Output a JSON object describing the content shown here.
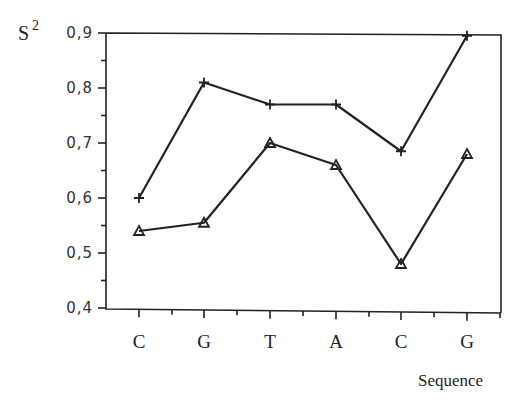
{
  "chart_data": {
    "type": "line",
    "title": "",
    "xlabel": "Sequence",
    "ylabel": "S2",
    "ylabel_display": {
      "base": "S",
      "superscript": "2"
    },
    "categories": [
      "C",
      "G",
      "T",
      "A",
      "C",
      "G"
    ],
    "y_ticks": [
      "0,4",
      "0,5",
      "0,6",
      "0,7",
      "0,8",
      "0,9"
    ],
    "y_tick_values": [
      0.4,
      0.5,
      0.6,
      0.7,
      0.8,
      0.9
    ],
    "ylim": [
      0.4,
      0.9
    ],
    "grid": false,
    "legend": null,
    "series": [
      {
        "name": "plus-marker series",
        "marker": "+",
        "values": [
          0.6,
          0.81,
          0.77,
          0.77,
          0.685,
          0.895
        ]
      },
      {
        "name": "triangle-marker series",
        "marker": "triangle",
        "values": [
          0.54,
          0.555,
          0.7,
          0.66,
          0.48,
          0.68
        ]
      }
    ]
  }
}
